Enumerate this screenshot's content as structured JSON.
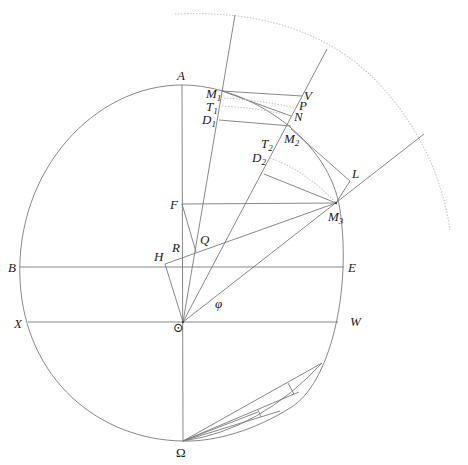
{
  "figure": {
    "background": "#ffffff",
    "line_color": "#7a7a7a",
    "dotted_color": "#c8c8c8"
  },
  "labels": {
    "A": "A",
    "B": "B",
    "E": "E",
    "X": "X",
    "W": "W",
    "F": "F",
    "Q": "Q",
    "R": "R",
    "H": "H",
    "V": "V",
    "P": "P",
    "N": "N",
    "L": "L",
    "M": "M",
    "T": "T",
    "D": "D",
    "sub1": "1",
    "sub2": "2",
    "sub3": "3",
    "phi": "φ",
    "sun": "⊙",
    "omega": "Ω"
  },
  "points": {
    "sun": [
      183,
      322
    ],
    "A": [
      182,
      85
    ],
    "Omega": [
      183,
      441
    ],
    "F": [
      182,
      204
    ],
    "H": [
      165,
      264
    ],
    "M1": [
      222,
      91
    ],
    "M2": [
      291,
      129
    ],
    "M3": [
      336,
      203
    ],
    "V": [
      302,
      96
    ],
    "P": [
      296,
      108
    ],
    "N": [
      291,
      116
    ],
    "D1": [
      219,
      120
    ],
    "D2": [
      264,
      174
    ],
    "L": [
      350,
      181
    ]
  }
}
